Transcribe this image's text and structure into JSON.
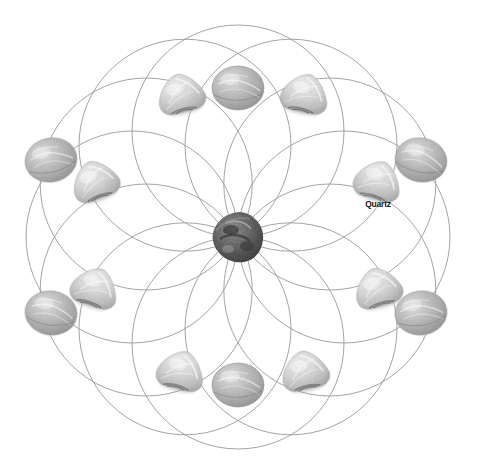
{
  "figure": {
    "kind": "crystal-grid-diagram",
    "background_color": "#ffffff",
    "line_color": "#9a9a9a",
    "line_width": 0.9,
    "canvas": {
      "width": 479,
      "height": 468
    }
  },
  "geometry": {
    "pattern_name": "flower-of-life",
    "center": {
      "x": 238,
      "y": 237
    },
    "circle_radius": 106,
    "ring_radius": 106,
    "circle_count": 12,
    "outer_extent": {
      "left": 17,
      "top": 24,
      "right": 458,
      "bottom": 448
    },
    "circle_centers": [
      {
        "x": 238.0,
        "y": 131.0,
        "angle_deg": 270
      },
      {
        "x": 291.0,
        "y": 145.2,
        "angle_deg": 300
      },
      {
        "x": 329.8,
        "y": 184.0,
        "angle_deg": 330
      },
      {
        "x": 344.0,
        "y": 237.0,
        "angle_deg": 0
      },
      {
        "x": 329.8,
        "y": 290.0,
        "angle_deg": 30
      },
      {
        "x": 291.0,
        "y": 328.8,
        "angle_deg": 60
      },
      {
        "x": 238.0,
        "y": 343.0,
        "angle_deg": 90
      },
      {
        "x": 185.0,
        "y": 328.8,
        "angle_deg": 120
      },
      {
        "x": 146.2,
        "y": 290.0,
        "angle_deg": 150
      },
      {
        "x": 132.0,
        "y": 237.0,
        "angle_deg": 180
      },
      {
        "x": 146.2,
        "y": 184.0,
        "angle_deg": 210
      },
      {
        "x": 185.0,
        "y": 145.2,
        "angle_deg": 240
      }
    ]
  },
  "center_stone": {
    "name": "center-stone",
    "type": "rough-dark-crystal",
    "label": "",
    "x": 238,
    "y": 237,
    "width": 52,
    "height": 50,
    "color": "#6e6e6e",
    "shadow_color": "#3c3c3c"
  },
  "labels": [
    {
      "name": "quartz-label",
      "text": "Quartz",
      "x": 378,
      "y": 207,
      "color": "#1a1a1a",
      "font_size": 8.5,
      "bold": true,
      "points_to": "triangular-stone-right-upper"
    }
  ],
  "stones": {
    "oval": {
      "type": "tumbled-oval-stone",
      "count": 6,
      "width": 52,
      "height": 44,
      "base_color": "#b9b9b9",
      "highlight_color": "#e4e4e4",
      "edge_color": "#8e8e8e",
      "positions": [
        {
          "name": "oval-stone-top",
          "x": 238,
          "y": 88,
          "rotate": 0
        },
        {
          "name": "oval-stone-upper-right",
          "x": 421,
          "y": 160,
          "rotate": 12
        },
        {
          "name": "oval-stone-lower-right",
          "x": 421,
          "y": 313,
          "rotate": -8
        },
        {
          "name": "oval-stone-bottom",
          "x": 238,
          "y": 385,
          "rotate": 0
        },
        {
          "name": "oval-stone-lower-left",
          "x": 51,
          "y": 313,
          "rotate": 8
        },
        {
          "name": "oval-stone-upper-left",
          "x": 51,
          "y": 160,
          "rotate": -12
        }
      ]
    },
    "triangular": {
      "type": "tumbled-triangular-stone",
      "count": 8,
      "width": 48,
      "height": 42,
      "base_color": "#d2d2d2",
      "highlight_color": "#f2f2f2",
      "edge_color": "#9e9e9e",
      "positions": [
        {
          "name": "triangular-stone-top-left",
          "x": 181,
          "y": 94,
          "rotate": -14
        },
        {
          "name": "triangular-stone-top-right",
          "x": 305,
          "y": 94,
          "rotate": 12
        },
        {
          "name": "triangular-stone-left-upper",
          "x": 95,
          "y": 181,
          "rotate": -20
        },
        {
          "name": "triangular-stone-right-upper",
          "x": 378,
          "y": 181,
          "rotate": 16
        },
        {
          "name": "triangular-stone-left-lower",
          "x": 95,
          "y": 288,
          "rotate": 18
        },
        {
          "name": "triangular-stone-right-lower",
          "x": 378,
          "y": 288,
          "rotate": -16
        },
        {
          "name": "triangular-stone-bottom-left",
          "x": 181,
          "y": 371,
          "rotate": 14
        },
        {
          "name": "triangular-stone-bottom-right",
          "x": 305,
          "y": 371,
          "rotate": -12
        }
      ]
    }
  }
}
